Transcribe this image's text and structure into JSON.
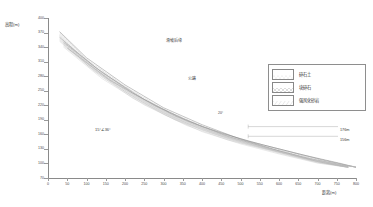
{
  "chart_data": {
    "type": "area",
    "title": "",
    "xlabel": "距离(m)",
    "ylabel": "高程(m)",
    "xlim": [
      0,
      800
    ],
    "ylim": [
      70,
      400
    ],
    "grid": false,
    "legend_position": "right",
    "xticks": [
      0,
      50,
      100,
      150,
      200,
      250,
      300,
      350,
      400,
      450,
      500,
      550,
      600,
      650,
      700,
      750,
      800
    ],
    "yticks": [
      70,
      100,
      130,
      160,
      190,
      220,
      250,
      280,
      310,
      340,
      370,
      400
    ],
    "series": [
      {
        "name": "坡面线",
        "comment": "ground surface profile, descending left to right",
        "x": [
          30,
          100,
          200,
          300,
          400,
          500,
          600,
          700,
          780
        ],
        "y": [
          372,
          318,
          262,
          215,
          180,
          150,
          126,
          104,
          92
        ]
      },
      {
        "name": "碎石土层底界",
        "comment": "base of gravel-soil layer",
        "x": [
          30,
          120,
          220,
          330,
          450,
          560,
          660,
          760,
          800
        ],
        "y": [
          360,
          300,
          245,
          198,
          162,
          138,
          118,
          100,
          92
        ]
      },
      {
        "name": "滑带",
        "comment": "slip surface / sliding zone",
        "x": [
          40,
          140,
          250,
          360,
          470,
          580,
          680,
          780
        ],
        "y": [
          350,
          288,
          232,
          188,
          155,
          130,
          110,
          94
        ]
      },
      {
        "name": "强风化砂岩顶界",
        "comment": "top of strongly weathered sandstone",
        "x": [
          50,
          160,
          280,
          400,
          520,
          620,
          720,
          800
        ],
        "y": [
          338,
          272,
          218,
          176,
          146,
          126,
          106,
          92
        ]
      }
    ],
    "annotations": [
      {
        "id": "scarp",
        "text": "滑坡后缘",
        "x": 310,
        "y": 352
      },
      {
        "id": "road",
        "text": "公路",
        "x": 385,
        "y": 258
      },
      {
        "id": "slope-angle",
        "text": "15°∠36°",
        "x": 135,
        "y": 168
      },
      {
        "id": "crest-angle",
        "text": "20°",
        "x": 470,
        "y": 200
      }
    ],
    "elevation_callouts": [
      {
        "label": "176m",
        "elevation": 176
      },
      {
        "label": "156m",
        "elevation": 156
      }
    ]
  },
  "legend": {
    "items": [
      {
        "label": "碎石土",
        "pattern": "dots"
      },
      {
        "label": "块碎石",
        "pattern": "cross-hatch"
      },
      {
        "label": "强风化砂岩",
        "pattern": "diagonal"
      }
    ]
  },
  "colors": {
    "axis": "#8a8a8a",
    "tick_text": "#4a4a4a",
    "line": "#8c8c8c",
    "annotation_text": "#3f3f3f",
    "legend_border": "#8e8e8e",
    "background": "#ffffff"
  }
}
